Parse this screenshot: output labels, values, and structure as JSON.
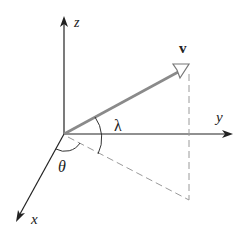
{
  "diagram": {
    "type": "3d-coordinate-vector",
    "origin": [
      64,
      134
    ],
    "axes": {
      "z": {
        "label": "z",
        "end": [
          64,
          18
        ],
        "label_pos": [
          76,
          24
        ]
      },
      "y": {
        "label": "y",
        "end": [
          232,
          134
        ],
        "label_pos": [
          219,
          121
        ]
      },
      "x": {
        "label": "x",
        "end": [
          16,
          222
        ],
        "label_pos": [
          32,
          222
        ]
      }
    },
    "vector": {
      "label": "v",
      "tip": [
        188,
        66
      ],
      "label_pos": [
        182,
        50
      ],
      "color": "#8a8a8a"
    },
    "projection": {
      "foot": [
        190,
        200
      ],
      "style": "dashed",
      "color": "#999999"
    },
    "angles": {
      "lambda": {
        "label": "λ",
        "label_pos": [
          115,
          128
        ]
      },
      "theta": {
        "label": "θ",
        "label_pos": [
          58,
          170
        ]
      }
    },
    "colors": {
      "axis": "#222222",
      "vector": "#8a8a8a",
      "dashed": "#9a9a9a"
    }
  }
}
